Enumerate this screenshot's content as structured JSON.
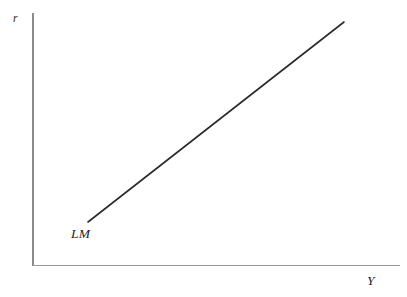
{
  "figure": {
    "background_color": "#ffffff",
    "width": 407,
    "height": 297
  },
  "axes": {
    "y_axis": {
      "label": "r",
      "color": "#8a8a8a",
      "x": 33,
      "y_top": 13,
      "y_bottom": 266
    },
    "x_axis": {
      "label": "Y",
      "color": "#9a9a9a",
      "y": 265,
      "x_left": 33,
      "x_right": 400
    }
  },
  "curves": [
    {
      "label": "LM",
      "color": "#2b2b2b",
      "x1": 88,
      "y1": 222,
      "x2": 344,
      "y2": 22,
      "stroke_width": 1.6
    }
  ],
  "chart_data": {
    "type": "line",
    "title": "",
    "xlabel": "Y",
    "ylabel": "r",
    "grid": false,
    "legend": "none",
    "annotations": [
      {
        "text": "LM",
        "x": 71,
        "y": 235
      }
    ],
    "series": [
      {
        "name": "LM",
        "x": [
          88,
          344
        ],
        "y": [
          222,
          22
        ],
        "description": "Upward-sloping LM curve in (Y, r) space"
      }
    ],
    "xlim": [
      33,
      400
    ],
    "ylim": [
      265,
      13
    ]
  }
}
